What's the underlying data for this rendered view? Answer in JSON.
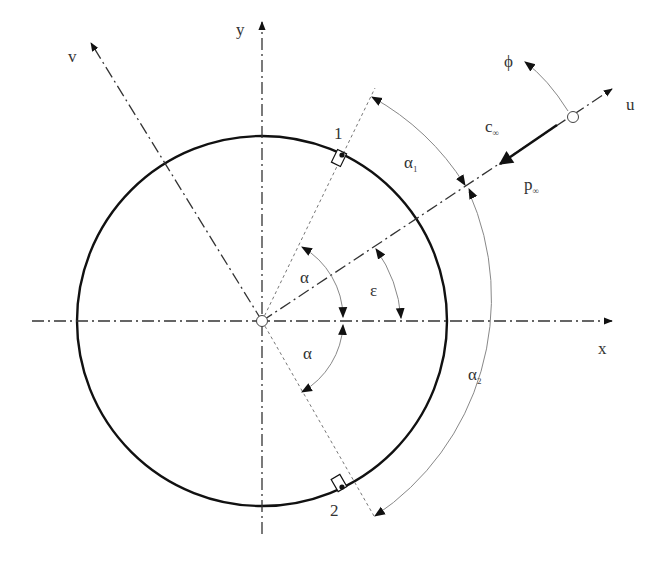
{
  "diagram": {
    "colors": {
      "stroke": "#111111",
      "thin": "#888888",
      "text": "#333333",
      "background": "#ffffff"
    },
    "geometry": {
      "center": [
        262,
        321
      ],
      "radius": 185,
      "epsilon_deg": 30,
      "alpha_deg": 60
    },
    "axes": {
      "x": {
        "label": "x"
      },
      "y": {
        "label": "y"
      },
      "u": {
        "label": "u"
      },
      "v": {
        "label": "v"
      }
    },
    "labels": {
      "alpha_upper": "α",
      "alpha_lower": "α",
      "epsilon": "ε",
      "alpha1": {
        "base": "α",
        "sub": "1"
      },
      "alpha2": {
        "base": "α",
        "sub": "2"
      },
      "c_inf": {
        "base": "c",
        "sub": "∞"
      },
      "p_inf": {
        "base": "p",
        "sub": "∞"
      },
      "phi": "ϕ",
      "tap1": "1",
      "tap2": "2"
    }
  }
}
